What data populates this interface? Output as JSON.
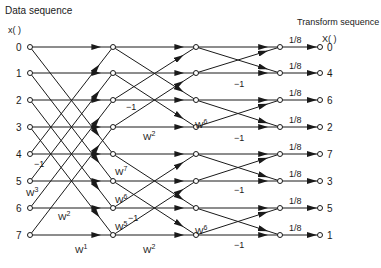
{
  "title_left": "Data sequence",
  "title_right": "Transform sequence",
  "input_header": "x(  )",
  "output_header": "X(  )",
  "inputs": [
    "0",
    "1",
    "2",
    "3",
    "4",
    "5",
    "6",
    "7"
  ],
  "outputs": [
    "0",
    "4",
    "6",
    "2",
    "7",
    "3",
    "5",
    "1"
  ],
  "scale_label": "1/8",
  "stage1_labels": [
    {
      "text": "-1",
      "x": 34,
      "y": 167
    },
    {
      "text": "W",
      "sup": "3",
      "x": 26,
      "y": 196
    },
    {
      "text": "W",
      "sup": "2",
      "x": 58,
      "y": 220
    },
    {
      "text": "W",
      "sup": "1",
      "x": 75,
      "y": 253
    }
  ],
  "stage2_labels": [
    {
      "text": "-1",
      "x": 126,
      "y": 110
    },
    {
      "text": "W",
      "sup": "2",
      "x": 143,
      "y": 140
    },
    {
      "text": "W",
      "sup": "7",
      "x": 115,
      "y": 175
    },
    {
      "text": "W",
      "sup": "6",
      "x": 115,
      "y": 203
    },
    {
      "text": "-1",
      "x": 128,
      "y": 221
    },
    {
      "text": "W",
      "sup": "5",
      "x": 115,
      "y": 230
    },
    {
      "text": "W",
      "sup": "2",
      "x": 143,
      "y": 253
    }
  ],
  "stage3_labels": [
    {
      "text": "-1",
      "x": 234,
      "y": 87
    },
    {
      "text": "W",
      "sup": "6",
      "x": 195,
      "y": 128
    },
    {
      "text": "-1",
      "x": 234,
      "y": 141
    },
    {
      "text": "-1",
      "x": 234,
      "y": 193
    },
    {
      "text": "W",
      "sup": "6",
      "x": 195,
      "y": 234
    },
    {
      "text": "-1",
      "x": 234,
      "y": 248
    }
  ],
  "colors": {
    "line": "#1a1a1a",
    "background": "#ffffff"
  }
}
